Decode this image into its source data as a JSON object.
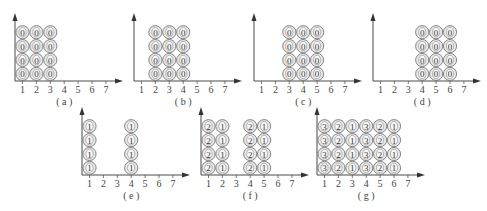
{
  "figure": {
    "x_ticks": [
      "1",
      "2",
      "3",
      "4",
      "5",
      "6",
      "7"
    ],
    "rows_per_column": 4,
    "panels": [
      {
        "id": "a",
        "caption": "( a )",
        "columns": [
          {
            "x": 1,
            "value": "0"
          },
          {
            "x": 2,
            "value": "0"
          },
          {
            "x": 3,
            "value": "0"
          }
        ]
      },
      {
        "id": "b",
        "caption": "( b )",
        "columns": [
          {
            "x": 2,
            "value": "0"
          },
          {
            "x": 3,
            "value": "0"
          },
          {
            "x": 4,
            "value": "0"
          }
        ]
      },
      {
        "id": "c",
        "caption": "( c )",
        "columns": [
          {
            "x": 3,
            "value": "0"
          },
          {
            "x": 4,
            "value": "0"
          },
          {
            "x": 5,
            "value": "0"
          }
        ]
      },
      {
        "id": "d",
        "caption": "( d )",
        "columns": [
          {
            "x": 4,
            "value": "0"
          },
          {
            "x": 5,
            "value": "0"
          },
          {
            "x": 6,
            "value": "0"
          }
        ]
      },
      {
        "id": "e",
        "caption": "( e )",
        "columns": [
          {
            "x": 1,
            "value": "1"
          },
          {
            "x": 4,
            "value": "1"
          }
        ]
      },
      {
        "id": "f",
        "caption": "( f )",
        "columns": [
          {
            "x": 1,
            "value": "2"
          },
          {
            "x": 2,
            "value": "1"
          },
          {
            "x": 4,
            "value": "2"
          },
          {
            "x": 5,
            "value": "1"
          }
        ]
      },
      {
        "id": "g",
        "caption": "( g )",
        "columns": [
          {
            "x": 1,
            "value": "3"
          },
          {
            "x": 2,
            "value": "2"
          },
          {
            "x": 3,
            "value": "1"
          },
          {
            "x": 4,
            "value": "3"
          },
          {
            "x": 5,
            "value": "2"
          },
          {
            "x": 6,
            "value": "1"
          }
        ]
      }
    ]
  }
}
